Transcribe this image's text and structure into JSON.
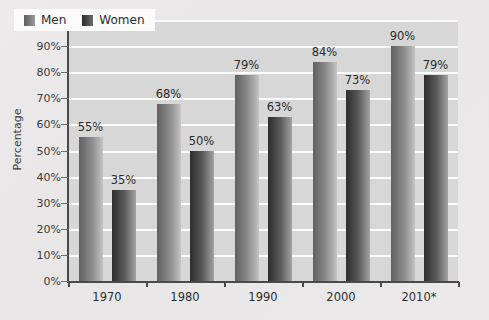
{
  "chart_data": {
    "type": "bar",
    "title": "",
    "xlabel": "",
    "ylabel": "Percentage",
    "ylim": [
      0,
      100
    ],
    "grid": true,
    "legend_position": "top-left",
    "categories": [
      "1970",
      "1980",
      "1990",
      "2000",
      "2010*"
    ],
    "series": [
      {
        "name": "Men",
        "color": "#7b7b7b",
        "values": [
          55,
          68,
          79,
          84,
          90
        ],
        "labels": [
          "55%",
          "68%",
          "79%",
          "84%",
          "90%"
        ]
      },
      {
        "name": "Women",
        "color": "#4a4a4a",
        "values": [
          35,
          50,
          63,
          73,
          79
        ],
        "labels": [
          "35%",
          "50%",
          "63%",
          "73%",
          "79%"
        ]
      }
    ],
    "y_ticks": [
      {
        "value": 100,
        "label": "100%"
      },
      {
        "value": 90,
        "label": "90%"
      },
      {
        "value": 80,
        "label": "80%"
      },
      {
        "value": 70,
        "label": "70%"
      },
      {
        "value": 60,
        "label": "60%"
      },
      {
        "value": 50,
        "label": "50%"
      },
      {
        "value": 40,
        "label": "40%"
      },
      {
        "value": 30,
        "label": "30%"
      },
      {
        "value": 20,
        "label": "20%"
      },
      {
        "value": 10,
        "label": "10%"
      },
      {
        "value": 0,
        "label": "0%"
      }
    ]
  },
  "legend": {
    "items": [
      {
        "label": "Men"
      },
      {
        "label": "Women"
      }
    ]
  },
  "colors": {
    "plot_background": "#d7d7d7",
    "page_background": "#eceaea",
    "gridline": "#fbfbfb",
    "axis": "#4a4a4a",
    "men_bar": "#7b7b7b",
    "women_bar": "#4a4a4a",
    "text": "#2b2b2b"
  }
}
